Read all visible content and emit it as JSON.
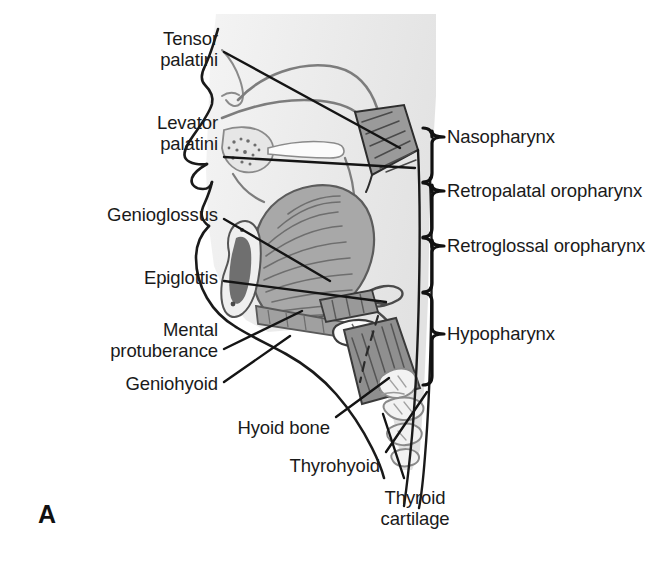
{
  "figure": {
    "panel_letter": "A",
    "background_color": "#ffffff",
    "tissue_fill": "#ececec",
    "tongue_fill": "#a8a8a8",
    "muscle_fill": "#8f8f8f",
    "outline_color": "#1a1a1a",
    "soft_outline_color": "#8a8a8a",
    "leader_color": "#141414"
  },
  "left_labels": [
    {
      "id": "tensor-palatini",
      "lines": [
        "Tensor",
        "palatini"
      ],
      "x": 218,
      "y": 28,
      "align": "right"
    },
    {
      "id": "levator-palatini",
      "lines": [
        "Levator",
        "palatini"
      ],
      "x": 218,
      "y": 112,
      "align": "right"
    },
    {
      "id": "genioglossus",
      "lines": [
        "Genioglossus"
      ],
      "x": 218,
      "y": 204,
      "align": "right"
    },
    {
      "id": "epiglottis",
      "lines": [
        "Epiglottis"
      ],
      "x": 218,
      "y": 267,
      "align": "right"
    },
    {
      "id": "mental-protuberance",
      "lines": [
        "Mental",
        "protuberance"
      ],
      "x": 218,
      "y": 319,
      "align": "right"
    },
    {
      "id": "geniohyoid",
      "lines": [
        "Geniohyoid"
      ],
      "x": 218,
      "y": 373,
      "align": "right"
    },
    {
      "id": "hyoid-bone",
      "lines": [
        "Hyoid bone"
      ],
      "x": 330,
      "y": 417,
      "align": "right"
    },
    {
      "id": "thyrohyoid",
      "lines": [
        "Thyrohyoid"
      ],
      "x": 380,
      "y": 455,
      "align": "right"
    },
    {
      "id": "thyroid-cartilage",
      "lines": [
        "Thyroid",
        "cartilage"
      ],
      "x": 415,
      "y": 487,
      "align": "center"
    }
  ],
  "right_labels": [
    {
      "id": "nasopharynx",
      "text": "Nasopharynx",
      "x": 447,
      "y": 141,
      "bracket_top": 128,
      "bracket_bottom": 182
    },
    {
      "id": "retropalatal-oropharynx",
      "text": "Retropalatal oropharynx",
      "x": 447,
      "y": 195,
      "bracket_top": 183,
      "bracket_bottom": 237
    },
    {
      "id": "retroglossal-oropharynx",
      "text": "Retroglossal oropharynx",
      "x": 447,
      "y": 250,
      "bracket_top": 238,
      "bracket_bottom": 292
    },
    {
      "id": "hypopharynx",
      "text": "Hypopharynx",
      "x": 447,
      "y": 338,
      "bracket_top": 293,
      "bracket_bottom": 385
    }
  ],
  "leader_lines": [
    {
      "id": "leader-tensor-palatini",
      "x1": 224,
      "y1": 52,
      "x2": 400,
      "y2": 148
    },
    {
      "id": "leader-levator-palatini",
      "x1": 224,
      "y1": 157,
      "x2": 415,
      "y2": 168
    },
    {
      "id": "leader-genioglossus",
      "x1": 224,
      "y1": 219,
      "x2": 330,
      "y2": 281
    },
    {
      "id": "leader-epiglottis",
      "x1": 224,
      "y1": 281,
      "x2": 386,
      "y2": 302
    },
    {
      "id": "leader-mental-protuberance",
      "x1": 224,
      "y1": 349,
      "x2": 302,
      "y2": 311
    },
    {
      "id": "leader-geniohyoid",
      "x1": 224,
      "y1": 382,
      "x2": 290,
      "y2": 336
    },
    {
      "id": "leader-hyoid-bone",
      "x1": 336,
      "y1": 417,
      "x2": 389,
      "y2": 378
    },
    {
      "id": "leader-thyrohyoid",
      "x1": 386,
      "y1": 452,
      "x2": 427,
      "y2": 392
    },
    {
      "id": "leader-thyroid-cartilage",
      "x1": 404,
      "y1": 478,
      "x2": 383,
      "y2": 414
    }
  ],
  "anatomy_regions": [
    {
      "id": "head-soft-tissue",
      "name": "head-soft-tissue"
    },
    {
      "id": "nasal-cavity",
      "name": "nasal-cavity"
    },
    {
      "id": "hard-palate",
      "name": "hard-palate"
    },
    {
      "id": "soft-palate-muscle",
      "name": "soft-palate-muscle"
    },
    {
      "id": "tongue",
      "name": "tongue"
    },
    {
      "id": "mandible",
      "name": "mandible"
    },
    {
      "id": "epiglottis-shape",
      "name": "epiglottis-shape"
    },
    {
      "id": "hyoid-bone-shape",
      "name": "hyoid-bone-shape"
    },
    {
      "id": "strap-muscles",
      "name": "strap-muscles"
    },
    {
      "id": "larynx-cartilage",
      "name": "larynx-cartilage"
    },
    {
      "id": "cervical-spine",
      "name": "cervical-spine"
    },
    {
      "id": "posterior-pharyngeal-wall",
      "name": "posterior-pharyngeal-wall"
    }
  ]
}
